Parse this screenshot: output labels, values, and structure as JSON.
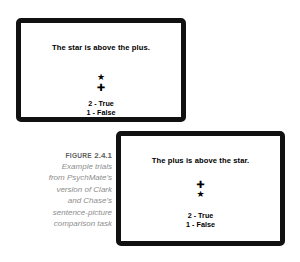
{
  "figure": {
    "caption": {
      "label_smallcaps": "FIGURE",
      "number": "2.4.1",
      "lines": [
        "Example trials",
        "from PsychMate's",
        "version of Clark",
        "and Chase's",
        "sentence-picture",
        "comparison task"
      ]
    },
    "colors": {
      "bezel": "#111111",
      "screen_background": "#ffffff",
      "text": "#000000",
      "caption_text": "#8d8d8d",
      "caption_title_text": "#5f5f5f",
      "page_background": "#ffffff"
    },
    "screens": [
      {
        "id": "trial-1",
        "sentence": "The star is above the plus.",
        "symbols": [
          {
            "name": "star-glyph",
            "char": "★"
          },
          {
            "name": "plus-glyph",
            "char": "✚"
          }
        ],
        "options": [
          "2 - True",
          "1 - False"
        ]
      },
      {
        "id": "trial-2",
        "sentence": "The plus is above the star.",
        "symbols": [
          {
            "name": "plus-glyph",
            "char": "✚"
          },
          {
            "name": "star-glyph",
            "char": "★"
          }
        ],
        "options": [
          "2 - True",
          "1 - False"
        ]
      }
    ]
  }
}
